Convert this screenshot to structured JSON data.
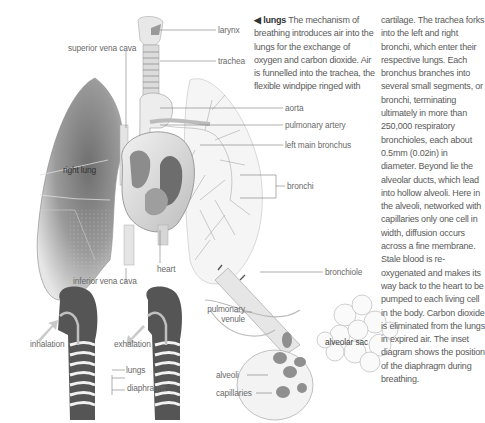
{
  "diagram": {
    "subject": "lungs",
    "labels": {
      "larynx": "larynx",
      "trachea": "trachea",
      "superior_vena_cava": "superior vena cava",
      "aorta": "aorta",
      "pulmonary_artery": "pulmonary artery",
      "left_main_bronchus": "left main bronchus",
      "right_lung": "right lung",
      "bronchi": "bronchi",
      "heart": "heart",
      "inferior_vena_cava": "inferior vena cava",
      "bronchiole": "bronchiole",
      "pulmonary_venule_1": "pulmonary",
      "pulmonary_venule_2": "venule",
      "alveolar_sac": "alveolar sac",
      "alveoli": "alveoli",
      "capillaries": "capillaries"
    },
    "inset": {
      "inhalation": "inhalation",
      "exhalation": "exhalation",
      "lungs": "lungs",
      "diaphragm": "diaphragm"
    }
  },
  "text": {
    "marker": "◀",
    "heading": "lungs",
    "col1": "The mechanism of breathing introduces air into the lungs for the exchange of oxygen and carbon dioxide. Air is funnelled into the trachea, the flexible windpipe ringed with",
    "col2": "cartilage. The trachea forks into the left and right bronchi, which enter their respective lungs. Each bronchus branches into several small segments, or bronchi, terminating ultimately in more than 250,000 respiratory bronchioles, each about 0.5mm (0.02in) in diameter. Beyond lie the alveolar ducts, which lead into hollow alveoli. Here in the alveoli, networked with capillaries only one cell in width, diffusion occurs across a fine membrane. Stale blood is re-oxygenated and makes its way back to the heart to be pumped to each living cell in the body. Carbon dioxide is eliminated from the lungs in expired air. The inset diagram shows the position of the diaphragm during breathing."
  },
  "colors": {
    "arrow": "#c9c9c9",
    "silhouette": "#555555",
    "lung_shade": "#8a8a8a"
  }
}
